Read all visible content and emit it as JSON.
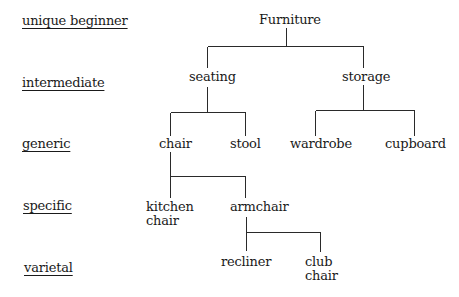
{
  "levels": [
    {
      "label": "unique beginner"
    },
    {
      "label": "intermediate"
    },
    {
      "label": "generic"
    },
    {
      "label": "specific"
    },
    {
      "label": "varietal"
    }
  ],
  "tree": {
    "root": "Furniture",
    "intermediate": [
      "seating",
      "storage"
    ],
    "generic": {
      "seating": [
        "chair",
        "stool"
      ],
      "storage": [
        "wardrobe",
        "cupboard"
      ]
    },
    "specific": {
      "chair": [
        [
          "kitchen",
          "chair"
        ],
        [
          "armchair"
        ]
      ]
    },
    "varietal": {
      "armchair": [
        [
          "recliner"
        ],
        [
          "club",
          "chair"
        ]
      ]
    }
  },
  "nodes": {
    "furniture": "Furniture",
    "seating": "seating",
    "storage": "storage",
    "chair": "chair",
    "stool": "stool",
    "wardrobe": "wardrobe",
    "cupboard": "cupboard",
    "kitchen_chair": {
      "line1": "kitchen",
      "line2": "chair"
    },
    "armchair": "armchair",
    "recliner": "recliner",
    "club_chair": {
      "line1": "club",
      "line2": "chair"
    }
  }
}
